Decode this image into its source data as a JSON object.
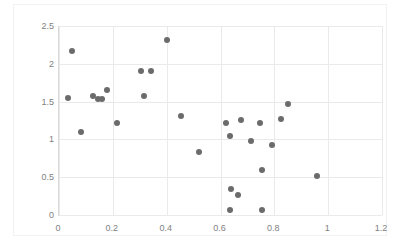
{
  "chart_data": {
    "type": "scatter",
    "title": "",
    "subtitle": "",
    "xlabel": "",
    "ylabel": "",
    "xlim": [
      0,
      1.2
    ],
    "ylim": [
      0,
      2.5
    ],
    "xticks": [
      "0",
      "0.2",
      "0.4",
      "0.6",
      "0.8",
      "1",
      "1.2"
    ],
    "xtick_values": [
      0,
      0.2,
      0.4,
      0.6,
      0.8,
      1,
      1.2
    ],
    "yticks": [
      "0",
      "0.5",
      "1",
      "1.5",
      "2",
      "2.5"
    ],
    "ytick_values": [
      0,
      0.5,
      1,
      1.5,
      2,
      2.5
    ],
    "grid": true,
    "legend": false,
    "legend_position": "none",
    "marker_color": "#6b6b6b",
    "marker_size_px": 6,
    "gridline_color": "#eaeaea",
    "axis_color": "#d9d9d9",
    "tick_label_color": "#7f7f7f",
    "series": [
      {
        "name": "series-1",
        "points": [
          [
            0.035,
            1.55
          ],
          [
            0.05,
            2.17
          ],
          [
            0.08,
            1.1
          ],
          [
            0.125,
            1.58
          ],
          [
            0.145,
            1.54
          ],
          [
            0.16,
            1.53
          ],
          [
            0.18,
            1.66
          ],
          [
            0.215,
            1.22
          ],
          [
            0.305,
            1.91
          ],
          [
            0.315,
            1.58
          ],
          [
            0.34,
            1.91
          ],
          [
            0.4,
            2.32
          ],
          [
            0.455,
            1.31
          ],
          [
            0.52,
            0.83
          ],
          [
            0.62,
            1.22
          ],
          [
            0.635,
            1.05
          ],
          [
            0.635,
            0.06
          ],
          [
            0.64,
            0.35
          ],
          [
            0.665,
            0.27
          ],
          [
            0.675,
            1.26
          ],
          [
            0.715,
            0.98
          ],
          [
            0.745,
            1.22
          ],
          [
            0.755,
            0.06
          ],
          [
            0.755,
            0.59
          ],
          [
            0.79,
            0.92
          ],
          [
            0.825,
            1.27
          ],
          [
            0.85,
            1.47
          ],
          [
            0.96,
            0.51
          ]
        ]
      }
    ]
  }
}
